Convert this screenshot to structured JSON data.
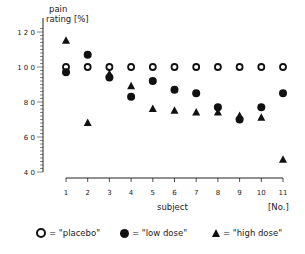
{
  "chart_data": {
    "type": "scatter",
    "title": "",
    "ylabel": "pain rating [%]",
    "xlabel": "subject",
    "xunit": "[No.]",
    "ylim": [
      40,
      120
    ],
    "yticks": [
      40,
      60,
      80,
      100,
      120
    ],
    "ytick_labels": [
      "4 0",
      "6 0",
      "8 0",
      "1 0 0",
      "1 2 0"
    ],
    "categories": [
      "1",
      "2",
      "3",
      "4",
      "5",
      "6",
      "7",
      "8",
      "9",
      "10",
      "11"
    ],
    "grid": false,
    "legend_position": "bottom",
    "series": [
      {
        "name": "placebo",
        "marker": "open-circle",
        "values": [
          100,
          100,
          100,
          100,
          100,
          100,
          100,
          100,
          100,
          100,
          100
        ]
      },
      {
        "name": "low dose",
        "marker": "filled-circle",
        "values": [
          97,
          107,
          94,
          83,
          92,
          87,
          85,
          77,
          70,
          77,
          85
        ]
      },
      {
        "name": "high dose",
        "marker": "filled-triangle",
        "values": [
          115,
          68,
          96,
          89,
          76,
          75,
          74,
          74,
          72,
          71,
          47
        ]
      }
    ]
  },
  "legend": {
    "placebo": "= \"placebo\"",
    "low_dose": "= \"low dose\"",
    "high_dose": "= \"high dose\""
  },
  "axis": {
    "y_title_line1": "pain",
    "y_title_line2": "rating [%]",
    "x_title": "subject",
    "x_unit": "[No.]"
  }
}
